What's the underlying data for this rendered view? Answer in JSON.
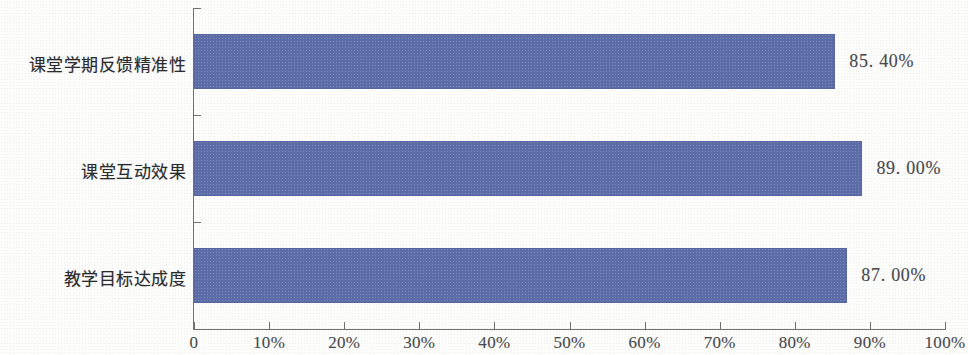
{
  "chart_data": {
    "type": "bar",
    "orientation": "horizontal",
    "title": "",
    "xlabel": "",
    "ylabel": "",
    "xlim": [
      0,
      100
    ],
    "grid": false,
    "legend": null,
    "bar_color": "#5B6CA8",
    "axis_color": "#6F7072",
    "categories": [
      "课堂学期反馈精准性",
      "课堂互动效果",
      "教学目标达成度"
    ],
    "values": [
      85.4,
      89.0,
      87.0
    ],
    "value_labels": [
      "85. 40%",
      "89. 00%",
      "87. 00%"
    ],
    "xticks": [
      0,
      10,
      20,
      30,
      40,
      50,
      60,
      70,
      80,
      90,
      100
    ],
    "xtick_labels": [
      "0",
      "10%",
      "20%",
      "30%",
      "40%",
      "50%",
      "60%",
      "70%",
      "80%",
      "90%",
      "100%"
    ]
  }
}
